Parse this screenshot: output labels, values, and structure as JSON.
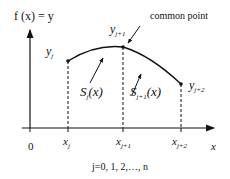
{
  "diagram": {
    "y_axis_label": "f (x) = y",
    "x_axis_label": "x",
    "origin_label": "0",
    "annotation": "common point",
    "footer": "j=0, 1, 2,…, n",
    "points": [
      {
        "y_label": "y",
        "y_sub": "j",
        "x_label": "x",
        "x_sub": "j"
      },
      {
        "y_label": "y",
        "y_sub": "j+1",
        "x_label": "x",
        "x_sub": "j+1"
      },
      {
        "y_label": "y",
        "y_sub": "j+2",
        "x_label": "x",
        "x_sub": "j+2"
      }
    ],
    "segments": [
      {
        "label": "S",
        "sub": "j",
        "arg": "(x)"
      },
      {
        "label": "S",
        "sub": "j+1",
        "arg": "(x)"
      }
    ]
  }
}
